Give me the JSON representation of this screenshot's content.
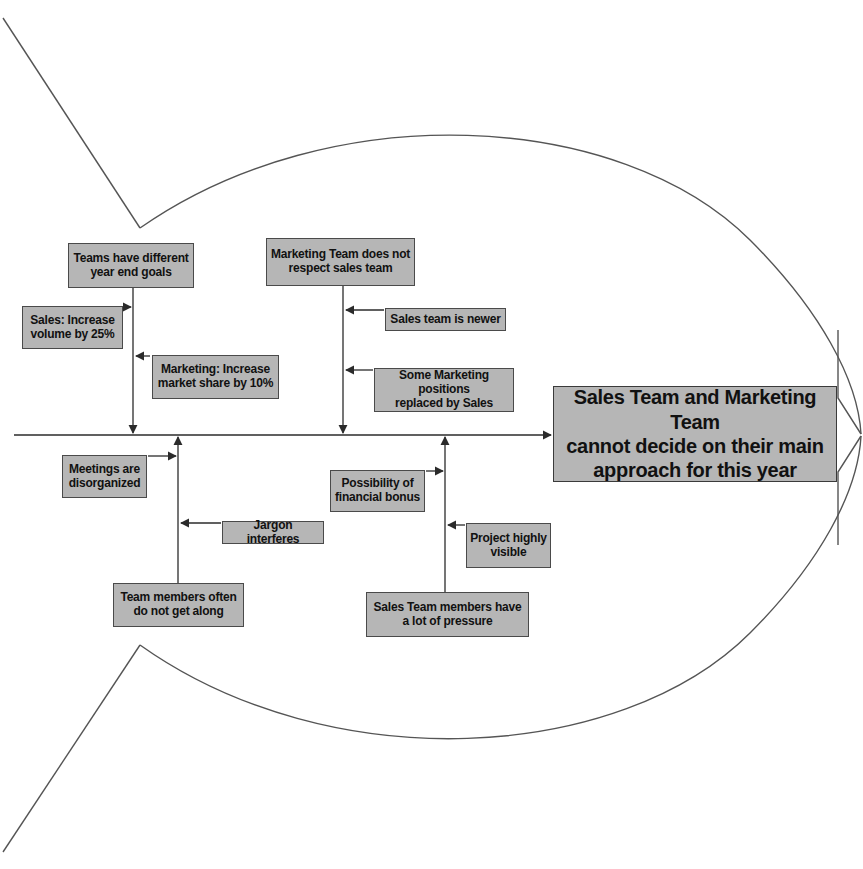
{
  "diagram": {
    "type": "fishbone-ishikawa",
    "title_visible": false,
    "colors": {
      "box_fill": "#b6b6b6",
      "box_border": "#4a4a4a",
      "text": "#111111",
      "bone": "#2b2b2b",
      "outline": "#555555",
      "background": "#ffffff"
    },
    "effect": {
      "label": "Sales Team and Marketing Team\ncannot decide on their main\napproach for this year"
    },
    "spine": {
      "x_start": 14,
      "x_end": 553,
      "y": 435
    },
    "categories": [
      {
        "id": "goals",
        "position": "upper-left",
        "head": {
          "label": "Teams have different\nyear end goals",
          "x": 68,
          "y": 243,
          "w": 126,
          "h": 45
        },
        "bone_x": 133,
        "bone_y_top": 288,
        "bone_y_bottom": 435,
        "causes": [
          {
            "label": "Sales: Increase\nvolume by 25%",
            "side": "left",
            "x": 22,
            "y": 306,
            "w": 101,
            "h": 43,
            "connect_y": 307
          },
          {
            "label": "Marketing: Increase\nmarket share by 10%",
            "side": "right",
            "x": 152,
            "y": 355,
            "w": 127,
            "h": 44,
            "connect_y": 356
          }
        ]
      },
      {
        "id": "respect",
        "position": "upper-right",
        "head": {
          "label": "Marketing Team does not\nrespect sales team",
          "x": 266,
          "y": 238,
          "w": 149,
          "h": 48
        },
        "bone_x": 343,
        "bone_y_top": 286,
        "bone_y_bottom": 435,
        "causes": [
          {
            "label": "Sales team is newer",
            "side": "right",
            "x": 385,
            "y": 308,
            "w": 121,
            "h": 23,
            "connect_y": 310
          },
          {
            "label": "Some Marketing positions\nreplaced by Sales",
            "side": "right",
            "x": 374,
            "y": 368,
            "w": 140,
            "h": 44,
            "connect_y": 370
          }
        ]
      },
      {
        "id": "communication",
        "position": "lower-left",
        "head": {
          "label": "Team members often\ndo not get along",
          "x": 113,
          "y": 583,
          "w": 131,
          "h": 44
        },
        "bone_x": 178,
        "bone_y_top": 435,
        "bone_y_bottom": 583,
        "causes": [
          {
            "label": "Meetings are\ndisorganized",
            "side": "left",
            "x": 62,
            "y": 455,
            "w": 85,
            "h": 43,
            "connect_y": 456
          },
          {
            "label": "Jargon interferes",
            "side": "right",
            "x": 222,
            "y": 521,
            "w": 102,
            "h": 23,
            "connect_y": 523
          }
        ]
      },
      {
        "id": "pressure",
        "position": "lower-right",
        "head": {
          "label": "Sales Team members have\na lot of pressure",
          "x": 366,
          "y": 592,
          "w": 163,
          "h": 45
        },
        "bone_x": 445,
        "bone_y_top": 435,
        "bone_y_bottom": 592,
        "causes": [
          {
            "label": "Possibility of\nfinancial bonus",
            "side": "left",
            "x": 330,
            "y": 470,
            "w": 95,
            "h": 42,
            "connect_y": 471
          },
          {
            "label": "Project highly\nvisible",
            "side": "right",
            "x": 466,
            "y": 523,
            "w": 85,
            "h": 45,
            "connect_y": 525
          }
        ]
      }
    ]
  }
}
